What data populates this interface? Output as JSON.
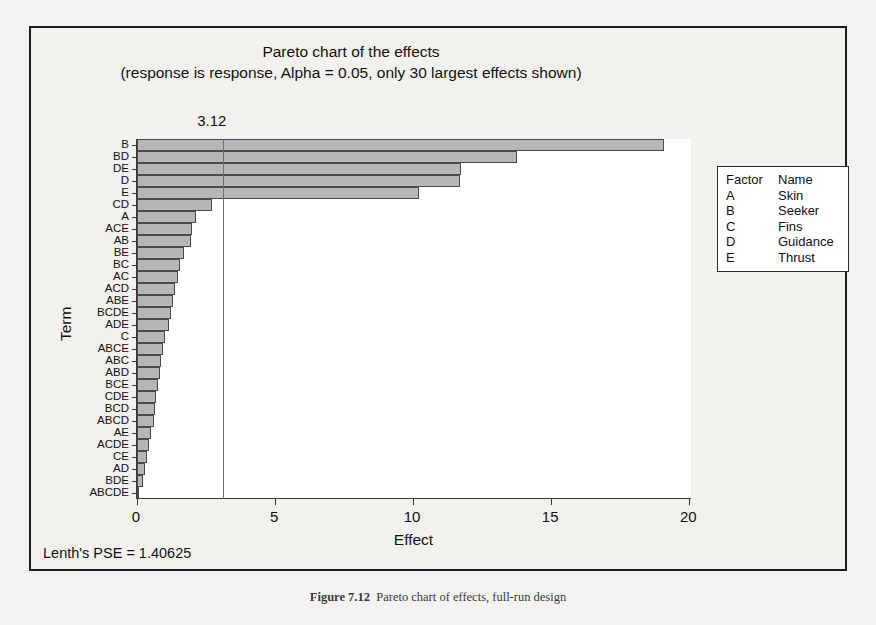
{
  "chart_data": {
    "type": "bar",
    "orientation": "horizontal",
    "title": "Pareto chart of the effects",
    "subtitle": "(response is response, Alpha = 0.05, only 30 largest effects shown)",
    "xlabel": "Effect",
    "ylabel": "Term",
    "xlim": [
      0,
      20.1
    ],
    "xticks": [
      0,
      5,
      10,
      15,
      20
    ],
    "xtick_labels": [
      "0",
      "5",
      "10",
      "15",
      "20"
    ],
    "grid": false,
    "legend_position": "right-outside",
    "reference_line": {
      "value": 3.12,
      "label": "3.12"
    },
    "categories": [
      "B",
      "BD",
      "DE",
      "D",
      "E",
      "CD",
      "A",
      "ACE",
      "AB",
      "BE",
      "BC",
      "AC",
      "ACD",
      "ABE",
      "BCDE",
      "ADE",
      "C",
      "ABCE",
      "ABC",
      "ABD",
      "BCE",
      "CDE",
      "BCD",
      "ABCD",
      "AE",
      "ACDE",
      "CE",
      "AD",
      "BDE",
      "ABCDE"
    ],
    "values": [
      19.1,
      13.78,
      11.72,
      11.68,
      10.22,
      2.7,
      2.12,
      2.0,
      1.94,
      1.72,
      1.56,
      1.5,
      1.38,
      1.3,
      1.22,
      1.16,
      1.0,
      0.94,
      0.88,
      0.82,
      0.76,
      0.7,
      0.66,
      0.6,
      0.5,
      0.44,
      0.38,
      0.3,
      0.22,
      0.06
    ],
    "series_name": "Standardized effect",
    "annotations": [
      "Lenth's PSE = 1.40625"
    ]
  },
  "figure": {
    "footer_note": "Lenth's PSE = 1.40625"
  },
  "legend": {
    "headers": {
      "factor": "Factor",
      "name": "Name"
    },
    "rows": [
      {
        "factor": "A",
        "name": "Skin"
      },
      {
        "factor": "B",
        "name": "Seeker"
      },
      {
        "factor": "C",
        "name": "Fins"
      },
      {
        "factor": "D",
        "name": "Guidance"
      },
      {
        "factor": "E",
        "name": "Thrust"
      }
    ]
  },
  "caption": {
    "label": "Figure 7.12",
    "text": "Pareto chart of effects, full-run design"
  },
  "scan_background": {
    "lines": [
      "response. Since the design is a resolution V design, the main effects and two-",
      "factor",
      "interactions are clear of aliasing with other effects. The analysis of",
      "the data",
      "was carried out using a statistical software package. The normal",
      "probability",
      "plot of the effects is shown in the figure, and the large effects are",
      "readily",
      "identified as B, D, E, BD, and DE. The Pareto chart in the figure also",
      "confirms",
      "this conclusion. The reference line on the Pareto chart is drawn at",
      "3.12, which",
      "corresponds to the value of t computed from Lenth's pseudo standard",
      "error",
      "PSE = 1.40625. Effects that exceed this reference line are considered",
      "active",
      "at the alpha = 0.05 level of significance. Note that the two-factor",
      "interaction",
      "BD and DE involve the guidance system, which also has a large main",
      "effect."
    ]
  },
  "colors": {
    "bar_fill": "#b7b7b7",
    "bar_edge": "#4a4a4a",
    "plot_bg": "#ffffff",
    "frame_bg": "#f2f1ee",
    "reference_line": "#6f6f6f",
    "text": "#111111"
  }
}
